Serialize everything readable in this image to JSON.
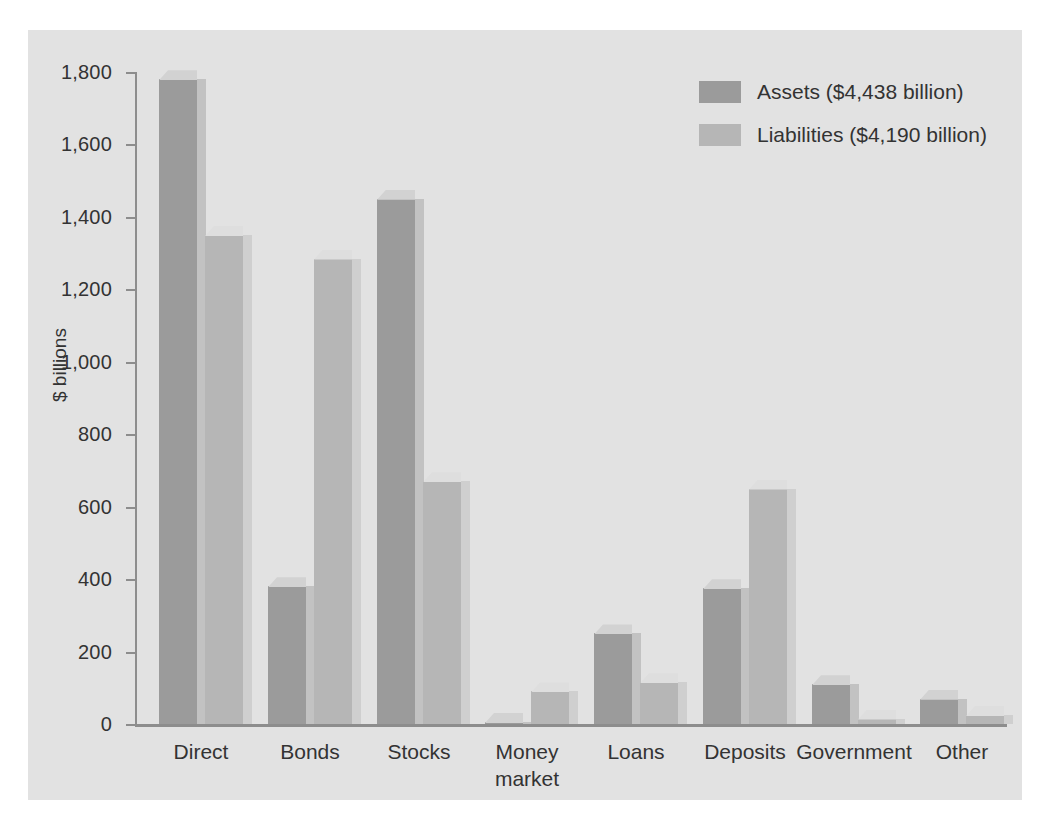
{
  "chart_data": {
    "type": "bar",
    "title": "",
    "xlabel": "",
    "ylabel": "$ billions",
    "ylim": [
      0,
      1800
    ],
    "ytick_values": [
      0,
      200,
      400,
      600,
      800,
      1000,
      1200,
      1400,
      1600,
      1800
    ],
    "ytick_labels": [
      "0",
      "200",
      "400",
      "600",
      "800",
      "1,000",
      "1,200",
      "1,400",
      "1,600",
      "1,800"
    ],
    "grid": false,
    "legend_position": "top-right",
    "categories": [
      "Direct",
      "Bonds",
      "Stocks",
      "Money market",
      "Loans",
      "Deposits",
      "Government",
      "Other"
    ],
    "category_labels": [
      {
        "line1": "Direct",
        "line2": ""
      },
      {
        "line1": "Bonds",
        "line2": ""
      },
      {
        "line1": "Stocks",
        "line2": ""
      },
      {
        "line1": "Money",
        "line2": "market"
      },
      {
        "line1": "Loans",
        "line2": ""
      },
      {
        "line1": "Deposits",
        "line2": ""
      },
      {
        "line1": "Government",
        "line2": ""
      },
      {
        "line1": "Other",
        "line2": ""
      }
    ],
    "series": [
      {
        "name": "Assets ($4,438 billion)",
        "short_name": "Assets",
        "total": "$4,438 billion",
        "color": "#9b9b9b",
        "values": [
          1780,
          380,
          1450,
          5,
          250,
          375,
          110,
          70
        ]
      },
      {
        "name": "Liabilities ($4,190 billion)",
        "short_name": "Liabilities",
        "total": "$4,190 billion",
        "color": "#b6b6b6",
        "values": [
          1350,
          1285,
          670,
          90,
          115,
          650,
          15,
          25
        ]
      }
    ]
  },
  "legend": {
    "items": [
      {
        "label": "Assets ($4,438 billion)",
        "color": "#9b9b9b"
      },
      {
        "label": "Liabilities ($4,190 billion)",
        "color": "#b6b6b6"
      }
    ]
  },
  "axis": {
    "y_title": "$ billions"
  },
  "colors": {
    "panel_background": "#e2e2e2",
    "figure_background": "#ffffff",
    "axis_line": "#8d8d8d",
    "text": "#333333",
    "assets_bar": "#9b9b9b",
    "assets_bar_top": "#d2d2d2",
    "liabilities_bar": "#b6b6b6",
    "liabilities_bar_top": "#dedede"
  }
}
